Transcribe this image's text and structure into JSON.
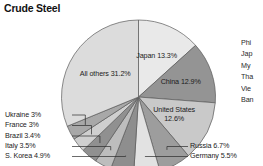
{
  "chart_data": {
    "type": "pie",
    "title": "Crude Steel",
    "xlabel": "",
    "ylabel": "",
    "legend_position": "labels-on-slices",
    "grid": false,
    "unit": "percent",
    "categories": [
      "Japan",
      "China",
      "United States",
      "Russia",
      "Germany",
      "S. Korea",
      "Italy",
      "Brazil",
      "France",
      "Ukraine",
      "All others"
    ],
    "values": [
      13.3,
      12.9,
      12.6,
      6.7,
      5.5,
      4.9,
      3.5,
      3.4,
      3.0,
      3.0,
      31.2
    ],
    "slices": [
      {
        "name": "Japan",
        "value": 13.3,
        "label": "Japan 13.3%",
        "color": "#e9e9e9",
        "label_style": "inside"
      },
      {
        "name": "China",
        "value": 12.9,
        "label": "China 12.9%",
        "color": "#949494",
        "label_style": "inside"
      },
      {
        "name": "United States",
        "value": 12.6,
        "label": "United States",
        "label_line2": "12.6%",
        "color": "#c9c9c9",
        "label_style": "inside"
      },
      {
        "name": "Russia",
        "value": 6.7,
        "label": "Russia 6.7%",
        "color": "#9d9d9d",
        "label_style": "leader-right"
      },
      {
        "name": "Germany",
        "value": 5.5,
        "label": "Germany 5.5%",
        "color": "#e2e2e2",
        "label_style": "leader-right"
      },
      {
        "name": "S. Korea",
        "value": 4.9,
        "label": "S. Korea 4.9%",
        "color": "#8e8e8e",
        "label_style": "leader-left"
      },
      {
        "name": "Italy",
        "value": 3.5,
        "label": "Italy 3.5%",
        "color": "#bdbdbd",
        "label_style": "leader-left"
      },
      {
        "name": "Brazil",
        "value": 3.4,
        "label": "Brazil 3.4%",
        "color": "#909090",
        "label_style": "leader-left"
      },
      {
        "name": "France",
        "value": 3.0,
        "label": "France 3%",
        "color": "#cfcfcf",
        "label_style": "leader-left"
      },
      {
        "name": "Ukraine",
        "value": 3.0,
        "label": "Ukraine 3%",
        "color": "#a8a8a8",
        "label_style": "leader-left"
      },
      {
        "name": "All others",
        "value": 31.2,
        "label": "All others 31.2%",
        "color": "#dcdcdc",
        "label_style": "inside"
      }
    ]
  },
  "side_legend": {
    "items": [
      {
        "text": "Phi"
      },
      {
        "text": "Jap"
      },
      {
        "text": "My"
      },
      {
        "text": "Tha"
      },
      {
        "text": "Vie"
      },
      {
        "text": "Ban"
      }
    ]
  },
  "colors": {
    "background": "#ffffff",
    "text": "#1b1b1b",
    "outline": "#5a5a5a"
  }
}
